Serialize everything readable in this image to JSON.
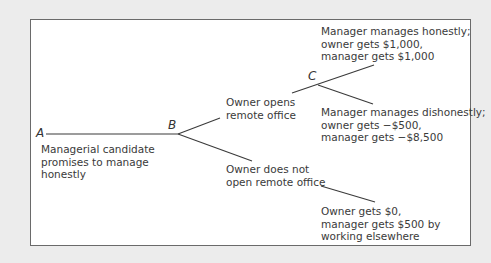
{
  "diagram": {
    "type": "game-tree",
    "nodes": {
      "A": "A",
      "B": "B",
      "C": "C"
    },
    "labels": {
      "candidate": [
        "Managerial candidate",
        "promises to manage",
        "honestly"
      ],
      "opens": [
        "Owner opens",
        "remote office"
      ],
      "not_open": [
        "Owner does not",
        "open remote office"
      ],
      "honest": [
        "Manager manages honestly;",
        "owner gets $1,000,",
        "manager gets $1,000"
      ],
      "dishonest": [
        "Manager manages dishonestly;",
        "owner gets −$500,",
        "manager gets −$8,500"
      ],
      "elsewhere": [
        "Owner gets $0,",
        "manager gets $500 by",
        "working elsewhere"
      ]
    },
    "colors": {
      "background": "#ececec",
      "panel": "#ffffff",
      "border": "#6a6a6a",
      "line": "#3a3a3a",
      "text": "#3a3a3a"
    }
  }
}
